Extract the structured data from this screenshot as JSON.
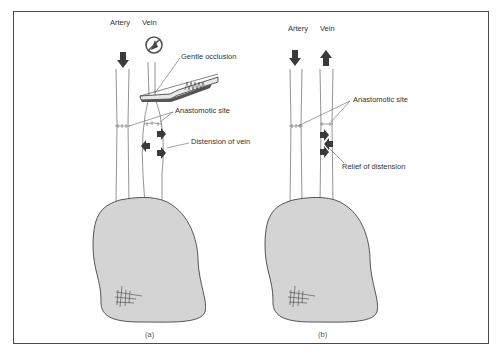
{
  "figure": {
    "panels": [
      {
        "id": "a",
        "caption": "(a)",
        "vessel_labels": {
          "artery": "Artery",
          "vein": "Vein"
        },
        "annotations": {
          "occlusion": "Gentle occlusion",
          "anastomosis": "Anastomotic site",
          "distension": "Distension of vein"
        },
        "icons": [
          "arrow-down-icon",
          "no-flow-icon",
          "clamp-icon",
          "outward-arrow-icon",
          "suture-mesh-icon"
        ]
      },
      {
        "id": "b",
        "caption": "(b)",
        "vessel_labels": {
          "artery": "Artery",
          "vein": "Vein"
        },
        "annotations": {
          "anastomosis": "Anastomotic site",
          "relief": "Relief of distension"
        },
        "icons": [
          "arrow-down-icon",
          "arrow-up-icon",
          "inward-arrow-icon",
          "suture-mesh-icon"
        ]
      }
    ],
    "colors": {
      "frame": "#4a4a4a",
      "line": "#555555",
      "arrow_fill": "#3a3a3a",
      "tissue_fill": "#d4d4d4",
      "tissue_stroke": "#444444"
    }
  }
}
